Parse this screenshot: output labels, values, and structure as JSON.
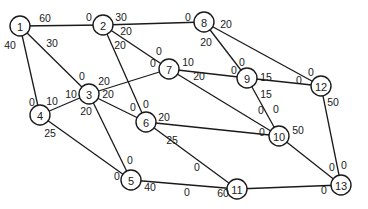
{
  "diagram": {
    "type": "network-flow-graph",
    "colors": {
      "stroke": "#1a1a1a",
      "background": "#ffffff",
      "node_fill": "#ffffff"
    },
    "node_radius": 10,
    "nodes": [
      {
        "id": "1",
        "label": "1",
        "x": 20,
        "y": 26
      },
      {
        "id": "2",
        "label": "2",
        "x": 103,
        "y": 25
      },
      {
        "id": "3",
        "label": "3",
        "x": 89,
        "y": 94
      },
      {
        "id": "4",
        "label": "4",
        "x": 40,
        "y": 115
      },
      {
        "id": "5",
        "label": "5",
        "x": 131,
        "y": 180
      },
      {
        "id": "6",
        "label": "6",
        "x": 146,
        "y": 122
      },
      {
        "id": "7",
        "label": "7",
        "x": 169,
        "y": 69
      },
      {
        "id": "8",
        "label": "8",
        "x": 204,
        "y": 22
      },
      {
        "id": "9",
        "label": "9",
        "x": 247,
        "y": 78
      },
      {
        "id": "10",
        "label": "10",
        "x": 279,
        "y": 136
      },
      {
        "id": "11",
        "label": "11",
        "x": 237,
        "y": 189
      },
      {
        "id": "12",
        "label": "12",
        "x": 321,
        "y": 86
      },
      {
        "id": "13",
        "label": "13",
        "x": 341,
        "y": 185
      }
    ],
    "edges": [
      {
        "from": "1",
        "to": "2",
        "cap_from": "60",
        "cap_to": "0"
      },
      {
        "from": "1",
        "to": "3",
        "cap_from": "30",
        "cap_to": "0"
      },
      {
        "from": "1",
        "to": "4",
        "cap_from": "40",
        "cap_to": "0"
      },
      {
        "from": "2",
        "to": "8",
        "cap_from": "30",
        "cap_to": "0"
      },
      {
        "from": "2",
        "to": "7",
        "cap_from": "20",
        "cap_to": "0"
      },
      {
        "from": "2",
        "to": "6",
        "cap_from": "20",
        "cap_to": "0"
      },
      {
        "from": "3",
        "to": "7",
        "cap_from": "20",
        "cap_to": "0"
      },
      {
        "from": "3",
        "to": "6",
        "cap_from": "20",
        "cap_to": "0"
      },
      {
        "from": "3",
        "to": "5",
        "cap_from": "20",
        "cap_to": "0"
      },
      {
        "from": "4",
        "to": "3",
        "cap_from": "10",
        "cap_to": "10"
      },
      {
        "from": "4",
        "to": "5",
        "cap_from": "25",
        "cap_to": "0"
      },
      {
        "from": "7",
        "to": "9",
        "cap_from": "10",
        "cap_to": "0"
      },
      {
        "from": "7",
        "to": "10",
        "cap_from": "20",
        "cap_to": "0"
      },
      {
        "from": "8",
        "to": "9",
        "cap_from": "20",
        "cap_to": "0"
      },
      {
        "from": "8",
        "to": "12",
        "cap_from": "20",
        "cap_to": "0"
      },
      {
        "from": "9",
        "to": "12",
        "cap_from": "15",
        "cap_to": "0"
      },
      {
        "from": "9",
        "to": "10",
        "cap_from": "15",
        "cap_to": "0"
      },
      {
        "from": "6",
        "to": "10",
        "cap_from": "20",
        "cap_to": "0"
      },
      {
        "from": "6",
        "to": "11",
        "cap_from": "25",
        "cap_to": "0"
      },
      {
        "from": "5",
        "to": "11",
        "cap_from": "40",
        "cap_to": "0"
      },
      {
        "from": "12",
        "to": "13",
        "cap_from": "50",
        "cap_to": "0"
      },
      {
        "from": "10",
        "to": "13",
        "cap_from": "50",
        "cap_to": "0"
      },
      {
        "from": "11",
        "to": "13",
        "cap_from": "60",
        "cap_to": "0"
      }
    ],
    "labels": [
      {
        "text": "60",
        "x": 45,
        "y": 18
      },
      {
        "text": "0",
        "x": 89,
        "y": 17
      },
      {
        "text": "40",
        "x": 10,
        "y": 45
      },
      {
        "text": "30",
        "x": 52,
        "y": 43
      },
      {
        "text": "30",
        "x": 121,
        "y": 17
      },
      {
        "text": "0",
        "x": 188,
        "y": 17
      },
      {
        "text": "20",
        "x": 226,
        "y": 24
      },
      {
        "text": "20",
        "x": 126,
        "y": 31
      },
      {
        "text": "20",
        "x": 120,
        "y": 45
      },
      {
        "text": "20",
        "x": 206,
        "y": 42
      },
      {
        "text": "0",
        "x": 159,
        "y": 51
      },
      {
        "text": "0",
        "x": 153,
        "y": 63
      },
      {
        "text": "10",
        "x": 188,
        "y": 62
      },
      {
        "text": "20",
        "x": 199,
        "y": 76
      },
      {
        "text": "0",
        "x": 242,
        "y": 62
      },
      {
        "text": "0",
        "x": 234,
        "y": 70
      },
      {
        "text": "15",
        "x": 266,
        "y": 77
      },
      {
        "text": "0",
        "x": 311,
        "y": 72
      },
      {
        "text": "0",
        "x": 299,
        "y": 80
      },
      {
        "text": "15",
        "x": 266,
        "y": 94
      },
      {
        "text": "50",
        "x": 333,
        "y": 102
      },
      {
        "text": "0",
        "x": 82,
        "y": 76
      },
      {
        "text": "20",
        "x": 104,
        "y": 81
      },
      {
        "text": "10",
        "x": 71,
        "y": 94
      },
      {
        "text": "20",
        "x": 108,
        "y": 94
      },
      {
        "text": "20",
        "x": 86,
        "y": 111
      },
      {
        "text": "0",
        "x": 32,
        "y": 102
      },
      {
        "text": "10",
        "x": 52,
        "y": 101
      },
      {
        "text": "25",
        "x": 50,
        "y": 133
      },
      {
        "text": "0",
        "x": 133,
        "y": 107
      },
      {
        "text": "0",
        "x": 146,
        "y": 104
      },
      {
        "text": "20",
        "x": 164,
        "y": 117
      },
      {
        "text": "25",
        "x": 172,
        "y": 140
      },
      {
        "text": "0",
        "x": 261,
        "y": 110
      },
      {
        "text": "0",
        "x": 276,
        "y": 109
      },
      {
        "text": "0",
        "x": 262,
        "y": 132
      },
      {
        "text": "50",
        "x": 298,
        "y": 130
      },
      {
        "text": "0",
        "x": 130,
        "y": 160
      },
      {
        "text": "0",
        "x": 117,
        "y": 176
      },
      {
        "text": "40",
        "x": 150,
        "y": 187
      },
      {
        "text": "0",
        "x": 197,
        "y": 167
      },
      {
        "text": "0",
        "x": 187,
        "y": 192
      },
      {
        "text": "60",
        "x": 223,
        "y": 193
      },
      {
        "text": "0",
        "x": 332,
        "y": 167
      },
      {
        "text": "0",
        "x": 344,
        "y": 165
      },
      {
        "text": "0",
        "x": 324,
        "y": 190
      }
    ]
  }
}
